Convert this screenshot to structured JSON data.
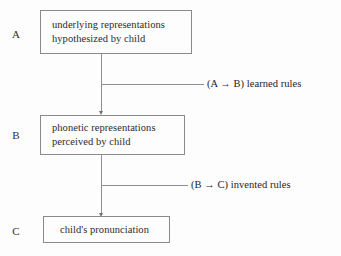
{
  "diagram": {
    "background_color": "#fdfdfd",
    "line_color": "#8f8f8f",
    "text_color": "#2b2b2b",
    "nodes": [
      {
        "stage": "A",
        "lines": [
          "underlying representations",
          "hypothesized by child"
        ]
      },
      {
        "stage": "B",
        "lines": [
          "phonetic representations",
          "perceived by child"
        ]
      },
      {
        "stage": "C",
        "lines": [
          "child's pronunciation"
        ]
      }
    ],
    "edges": [
      {
        "label": "(A → B) learned rules",
        "from": "A",
        "to": "B"
      },
      {
        "label": "(B → C) invented rules",
        "from": "B",
        "to": "C"
      }
    ]
  }
}
